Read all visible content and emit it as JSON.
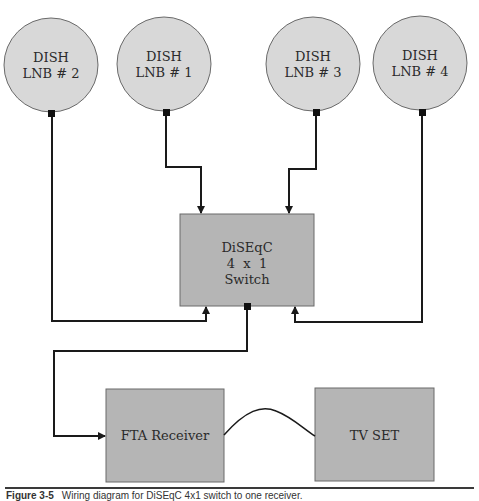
{
  "diagram": {
    "colors": {
      "dish_fill": "#d8d8d8",
      "box_fill": "#b5b5b5",
      "stroke": "#1a1a1a",
      "outline": "#6a6a6a"
    },
    "dishes": [
      {
        "id": "lnb2",
        "line1": "DISH",
        "line2": "LNB # 2",
        "cx": 51,
        "cy": 65,
        "r": 47
      },
      {
        "id": "lnb1",
        "line1": "DISH",
        "line2": "LNB # 1",
        "cx": 164,
        "cy": 64,
        "r": 47
      },
      {
        "id": "lnb3",
        "line1": "DISH",
        "line2": "LNB # 3",
        "cx": 313,
        "cy": 64,
        "r": 47
      },
      {
        "id": "lnb4",
        "line1": "DISH",
        "line2": "LNB # 4",
        "cx": 420,
        "cy": 63,
        "r": 47
      }
    ],
    "switch": {
      "line1": "DiSEqC",
      "line2": "4  x  1",
      "line3": "Switch"
    },
    "receiver": {
      "label": "FTA Receiver"
    },
    "tv": {
      "label": "TV SET"
    },
    "connections": [
      {
        "from": "DISH LNB # 1",
        "to": "DiSEqC 4 x 1 Switch"
      },
      {
        "from": "DISH LNB # 3",
        "to": "DiSEqC 4 x 1 Switch"
      },
      {
        "from": "DISH LNB # 2",
        "to": "DiSEqC 4 x 1 Switch"
      },
      {
        "from": "DISH LNB # 4",
        "to": "DiSEqC 4 x 1 Switch"
      },
      {
        "from": "DiSEqC 4 x 1 Switch",
        "to": "FTA Receiver"
      },
      {
        "from": "FTA Receiver",
        "to": "TV SET"
      }
    ]
  },
  "caption": {
    "figure": "Figure 3-5",
    "text": "Wiring diagram for DiSEqC 4x1 switch to one receiver."
  }
}
